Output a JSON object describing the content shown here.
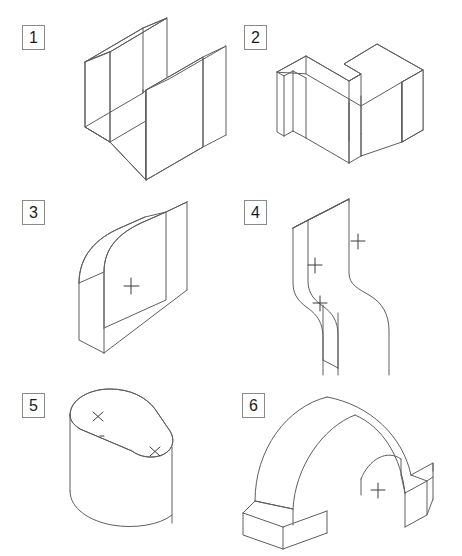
{
  "sheet": {
    "title": "Isometric Technical Drawing Exercise Sheet",
    "background_color": "#ffffff",
    "line_color": "#5e5e5e",
    "mark_color": "#3a3a3a",
    "width": 462,
    "height": 556,
    "grid": {
      "columns": 2,
      "rows": 3
    }
  },
  "figures": [
    {
      "number": "1",
      "name": "u-channel-block",
      "description": "U-shaped channel block in isometric view",
      "label_position": {
        "x": 22,
        "y": 25
      },
      "center_marks": []
    },
    {
      "number": "2",
      "name": "stepped-zigzag-block",
      "description": "Stepped zigzag prismatic block in isometric view",
      "label_position": {
        "x": 244,
        "y": 25
      },
      "center_marks": []
    },
    {
      "number": "3",
      "name": "rounded-corner-plate",
      "description": "Plate with large rounded corner in isometric view",
      "label_position": {
        "x": 22,
        "y": 200
      },
      "center_marks": [
        {
          "type": "plus",
          "x": 131,
          "y": 286
        }
      ]
    },
    {
      "number": "4",
      "name": "s-curve-plate",
      "description": "S-curved offset plate in isometric view",
      "label_position": {
        "x": 244,
        "y": 200
      },
      "center_marks": [
        {
          "type": "plus",
          "x": 358,
          "y": 241
        },
        {
          "type": "plus",
          "x": 315,
          "y": 265
        },
        {
          "type": "plus",
          "x": 320,
          "y": 303
        }
      ]
    },
    {
      "number": "5",
      "name": "teardrop-extrusion",
      "description": "Teardrop obround extruded solid in isometric view",
      "label_position": {
        "x": 22,
        "y": 393
      },
      "center_marks": [
        {
          "type": "cross",
          "x": 98,
          "y": 417
        },
        {
          "type": "cross",
          "x": 155,
          "y": 452
        },
        {
          "type": "dot",
          "x": 102,
          "y": 436
        }
      ]
    },
    {
      "number": "6",
      "name": "arch-tunnel-block",
      "description": "Arched tunnel block with flat base feet in isometric view",
      "label_position": {
        "x": 242,
        "y": 393
      },
      "center_marks": [
        {
          "type": "plus",
          "x": 378,
          "y": 490
        }
      ]
    }
  ]
}
